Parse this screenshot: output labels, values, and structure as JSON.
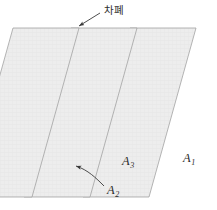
{
  "figure": {
    "background_color": "#ffffff",
    "plane_fill_color": "#ededed",
    "plane_edge_color": "#9a9a9a",
    "annotation_color": "#2f2f2f",
    "label_color": "#2b2b2b"
  },
  "planes": [
    {
      "id": "plane-left",
      "label": "A",
      "subscript": "2",
      "order": "front-left"
    },
    {
      "id": "plane-middle",
      "label": "A",
      "subscript": "3",
      "order": "middle"
    },
    {
      "id": "plane-right",
      "label": "A",
      "subscript": "1",
      "order": "back-right"
    }
  ],
  "labels": {
    "a1": {
      "base": "A",
      "sub": "1"
    },
    "a3": {
      "base": "A",
      "sub": "3"
    },
    "a2": {
      "base": "A",
      "sub": "2"
    },
    "shielding": "차폐"
  },
  "annotations": [
    {
      "name": "shielding-callout",
      "text": "차폐",
      "arrow": "straight",
      "points_to": "plane-middle-top-edge"
    },
    {
      "name": "a2-callout",
      "text": "A2",
      "arrow": "curved",
      "points_to": "plane-left-lower-area"
    }
  ]
}
